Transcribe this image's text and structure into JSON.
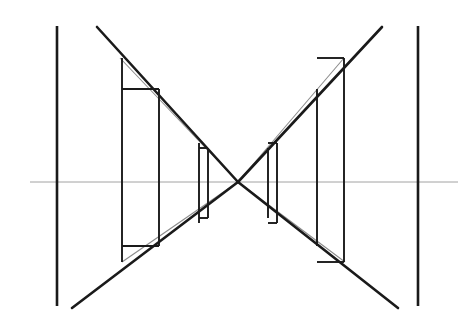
{
  "figure": {
    "canvas": {
      "width": 475,
      "height": 328,
      "background": "#ffffff"
    },
    "colors": {
      "ink_heavy": "#1a1a1a",
      "ink_medium": "#333333",
      "ink_light": "#8a8a8a",
      "background": "#ffffff"
    },
    "stroke_widths": {
      "heavy": 2.6,
      "medium": 1.9,
      "light": 0.8
    },
    "crossing_point": {
      "x": 238,
      "y": 182
    },
    "axis": {
      "name": "optical-axis",
      "orientation": "horizontal",
      "y": 182,
      "x_start": 30,
      "x_end": 458,
      "weight": "light"
    },
    "outer_verticals": [
      {
        "name": "left-outer-plane",
        "x": 57,
        "y_top": 26,
        "y_bottom": 306,
        "weight": "heavy"
      },
      {
        "name": "right-outer-plane",
        "x": 418,
        "y_top": 26,
        "y_bottom": 306,
        "weight": "heavy"
      }
    ],
    "heavy_diagonals": [
      {
        "name": "diagonal-upper-left-to-center",
        "x1": 97,
        "y1": 27,
        "x2": 238,
        "y2": 182
      },
      {
        "name": "diagonal-lower-left-to-center",
        "x1": 72,
        "y1": 308,
        "x2": 238,
        "y2": 182
      },
      {
        "name": "diagonal-center-to-upper-right",
        "x1": 238,
        "y1": 182,
        "x2": 382,
        "y2": 27
      },
      {
        "name": "diagonal-center-to-lower-right",
        "x1": 238,
        "y1": 182,
        "x2": 398,
        "y2": 308
      }
    ],
    "light_diagonals": [
      {
        "name": "thin-diagonal-upper-left",
        "x1": 120,
        "y1": 58,
        "x2": 238,
        "y2": 182
      },
      {
        "name": "thin-diagonal-lower-left",
        "x1": 122,
        "y1": 262,
        "x2": 238,
        "y2": 182
      },
      {
        "name": "thin-diagonal-upper-right",
        "x1": 238,
        "y1": 182,
        "x2": 344,
        "y2": 58
      },
      {
        "name": "thin-diagonal-lower-right",
        "x1": 238,
        "y1": 182,
        "x2": 345,
        "y2": 262
      }
    ],
    "left_elements": [
      {
        "name": "left-outer-lens-block",
        "front_x": 122,
        "back_x": 159,
        "front_y_top": 58,
        "front_y_bottom": 262,
        "back_y_top": 89,
        "back_y_bottom": 246,
        "top_edge": true,
        "bottom_edge": true
      },
      {
        "name": "left-inner-lens-block",
        "front_x": 199,
        "back_x": 208,
        "front_y_top": 143,
        "front_y_bottom": 223,
        "back_y_top": 148,
        "back_y_bottom": 218,
        "top_edge": true,
        "bottom_edge": true
      }
    ],
    "right_elements": [
      {
        "name": "right-inner-lens-block",
        "front_x": 268,
        "back_x": 277,
        "front_y_top": 148,
        "front_y_bottom": 218,
        "back_y_top": 143,
        "back_y_bottom": 223,
        "top_edge": true,
        "bottom_edge": true
      },
      {
        "name": "right-outer-lens-block",
        "front_x": 317,
        "back_x": 344,
        "front_y_top": 89,
        "front_y_bottom": 246,
        "back_y_top": 58,
        "back_y_bottom": 262,
        "top_edge": true,
        "bottom_edge": true
      }
    ]
  }
}
